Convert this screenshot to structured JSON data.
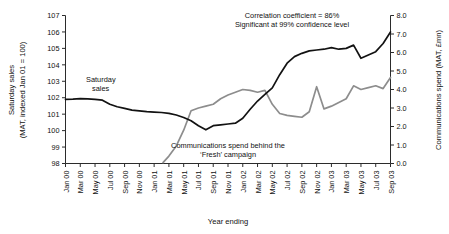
{
  "chart_data": {
    "type": "line",
    "title": "",
    "xlabel": "Year ending",
    "left_axis": {
      "label_line1": "Saturday sales",
      "label_line2": "(MAT, indexed Jan 01 = 100)",
      "ticks": [
        "98",
        "99",
        "100",
        "101",
        "102",
        "103",
        "104",
        "105",
        "106",
        "107"
      ],
      "ylim": [
        98,
        107
      ]
    },
    "right_axis": {
      "label": "Communications spend (MAT, £mn)",
      "ticks": [
        "0.0",
        "1.0",
        "2.0",
        "3.0",
        "4.0",
        "5.0",
        "6.0",
        "7.0",
        "8.0"
      ],
      "ylim": [
        0,
        8
      ]
    },
    "categories": [
      "Jan 00",
      "Mar 00",
      "May 00",
      "Jul 00",
      "Sep 00",
      "Nov 00",
      "Jan 01",
      "Mar 01",
      "May 01",
      "Jul 01",
      "Sep 01",
      "Nov 01",
      "Jan 02",
      "Mar 02",
      "May 02",
      "Jul 02",
      "Sep 02",
      "Nov 02",
      "Jan 03",
      "Mar 03",
      "May 03",
      "Jul 03",
      "Sep 03"
    ],
    "grid": false,
    "legend_position": "inline-annotations",
    "annotations": [
      {
        "name": "saturday-sales-label",
        "text": "Saturday\nsales",
        "line1": "Saturday",
        "line2": "sales"
      },
      {
        "name": "correlation-note",
        "line1": "Correlation coefficient = 86%",
        "line2": "Significant at 99% confidence level"
      },
      {
        "name": "campaign-note",
        "line1": "Communications spend behind the",
        "line2": "‘Fresh’ campaign"
      }
    ],
    "series": [
      {
        "name": "Saturday sales",
        "axis": "left",
        "color": "#121212",
        "x": [
          0,
          0.5,
          1,
          1.5,
          2,
          2.5,
          3,
          3.5,
          4,
          4.5,
          5,
          5.5,
          6,
          6.5,
          7,
          7.5,
          8,
          8.5,
          9,
          9.5,
          10,
          10.5,
          11,
          11.5,
          12,
          12.5,
          13,
          13.5,
          14,
          14.5,
          15,
          15.5,
          16,
          16.5,
          17,
          17.5,
          18,
          18.5,
          19,
          19.5,
          20,
          20.5,
          21,
          21.5,
          22
        ],
        "values": [
          101.9,
          101.92,
          101.95,
          101.93,
          101.9,
          101.85,
          101.6,
          101.45,
          101.35,
          101.25,
          101.2,
          101.15,
          101.12,
          101.1,
          101.05,
          100.95,
          100.8,
          100.6,
          100.3,
          100.05,
          100.3,
          100.35,
          100.4,
          100.45,
          100.75,
          101.3,
          101.8,
          102.2,
          102.6,
          103.4,
          104.1,
          104.5,
          104.7,
          104.85,
          104.9,
          104.95,
          105.05,
          104.95,
          105.0,
          105.2,
          104.4,
          104.6,
          104.8,
          105.3,
          106.0
        ]
      },
      {
        "name": "Communications spend",
        "axis": "right",
        "color": "#8d8d8d",
        "x": [
          6.6,
          7,
          7.5,
          8,
          8.5,
          9,
          9.5,
          10,
          10.5,
          11,
          11.5,
          12,
          12.5,
          13,
          13.5,
          14,
          14.5,
          15,
          15.5,
          16,
          16.5,
          17,
          17.5,
          18,
          18.5,
          19,
          19.5,
          20,
          20.5,
          21,
          21.5,
          22
        ],
        "values": [
          0.05,
          0.4,
          0.95,
          1.8,
          2.85,
          3.0,
          3.1,
          3.2,
          3.5,
          3.7,
          3.85,
          4.0,
          3.95,
          3.85,
          3.95,
          3.2,
          2.7,
          2.6,
          2.55,
          2.5,
          2.8,
          4.15,
          2.95,
          3.1,
          3.3,
          3.5,
          4.2,
          4.0,
          4.1,
          4.2,
          4.05,
          4.65
        ]
      }
    ]
  }
}
